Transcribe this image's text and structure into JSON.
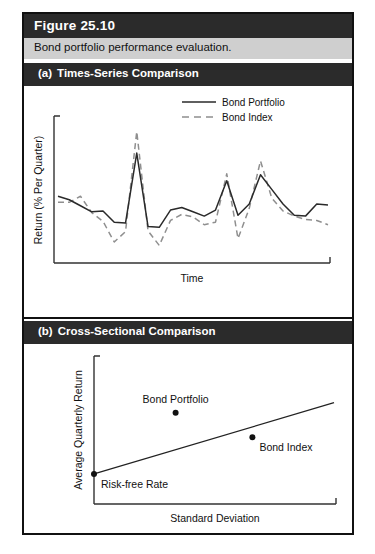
{
  "figure": {
    "number_label": "Figure 25.10",
    "caption": "Bond portfolio performance evaluation."
  },
  "panels": [
    {
      "letter": "(a)",
      "title": "Times-Series Comparison"
    },
    {
      "letter": "(b)",
      "title": "Cross-Sectional Comparison"
    }
  ],
  "legend": {
    "portfolio_label": "Bond Portfolio",
    "index_label": "Bond Index"
  },
  "chart_data": [
    {
      "type": "line",
      "panel": "(a)",
      "title": "Times-Series Comparison",
      "xlabel": "Time",
      "ylabel": "Return (% Per Quarter)",
      "grid": false,
      "legend_position": "top-right",
      "axis_ticks_labeled": false,
      "xlim": [
        0,
        24
      ],
      "ylim": [
        -3.2,
        5.2
      ],
      "x": [
        0,
        1,
        2,
        3,
        4,
        5,
        6,
        7,
        8,
        9,
        10,
        11,
        12,
        13,
        14,
        15,
        16,
        17,
        18,
        19,
        20,
        21,
        22,
        23,
        24
      ],
      "series": [
        {
          "name": "Bond Portfolio",
          "style": "solid",
          "color": "#2a2a2a",
          "values": [
            0.55,
            0.35,
            0.0,
            -0.35,
            -0.3,
            -0.95,
            -1.0,
            3.05,
            -1.2,
            -1.25,
            -0.25,
            -0.1,
            -0.35,
            -0.6,
            -0.25,
            1.45,
            -0.55,
            0.1,
            1.8,
            0.95,
            0.1,
            -0.55,
            -0.6,
            0.1,
            0.05
          ]
        },
        {
          "name": "Bond Index",
          "style": "dashed",
          "color": "#8f8f8f",
          "values": [
            0.2,
            0.2,
            0.55,
            -0.4,
            -0.9,
            -2.1,
            -1.5,
            4.3,
            -1.45,
            -2.3,
            -0.85,
            -0.5,
            -0.65,
            -1.1,
            -0.95,
            1.85,
            -1.9,
            -0.15,
            2.6,
            0.45,
            -0.3,
            -0.6,
            -0.8,
            -0.85,
            -1.1
          ]
        }
      ]
    },
    {
      "type": "scatter",
      "panel": "(b)",
      "title": "Cross-Sectional Comparison",
      "xlabel": "Standard Deviation",
      "ylabel": "Average Quarterly Return",
      "grid": false,
      "axis_ticks_labeled": false,
      "xlim": [
        0,
        10
      ],
      "ylim": [
        0,
        10
      ],
      "points": [
        {
          "label": "Bond Portfolio",
          "x": 3.4,
          "y": 6.2,
          "label_position": "above"
        },
        {
          "label": "Bond Index",
          "x": 6.6,
          "y": 4.5,
          "label_position": "below-right"
        },
        {
          "label": "Risk-free Rate",
          "x": 0.0,
          "y": 1.95,
          "label_position": "below-right"
        }
      ],
      "reference_line": {
        "name": "security-market-line",
        "from": {
          "x": 0.0,
          "y": 1.95
        },
        "to": {
          "x": 10.0,
          "y": 6.9
        }
      }
    }
  ]
}
